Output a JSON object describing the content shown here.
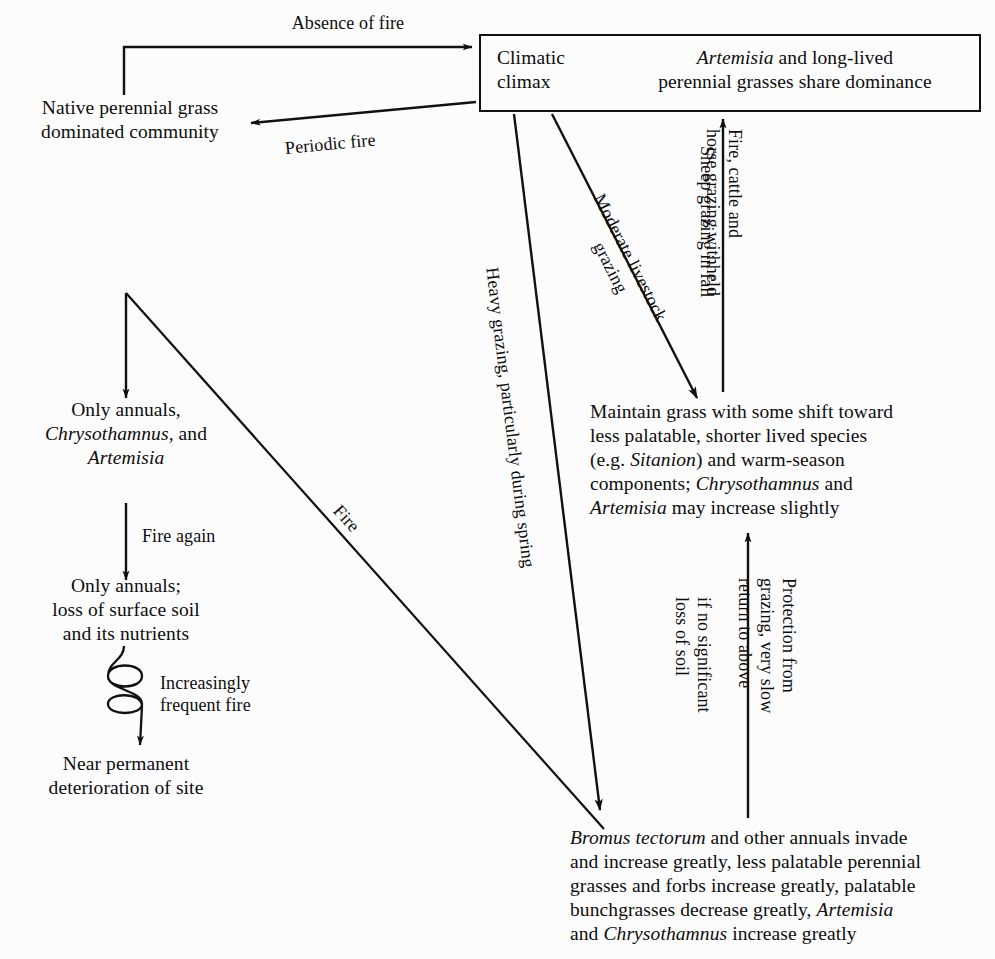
{
  "diagram": {
    "background_color": "#fcfcfc",
    "ink_color": "#111111"
  },
  "nodes": {
    "climatic_climax_label": "Climatic\nclimax",
    "climatic_climax_desc_line1_italic": "Artemisia",
    "climatic_climax_desc_line1_rest": " and long-lived",
    "climatic_climax_desc_line2": "perennial grasses share dominance",
    "native_grass": "Native perennial grass\ndominated community",
    "only_annuals_chrys": {
      "line1": "Only annuals,",
      "line2_italic": "Chrysothamnus",
      "line2_rest": ", and",
      "line3_italic": "Artemisia"
    },
    "only_annuals_soil": "Only annuals;\nloss of surface soil\nand its nutrients",
    "near_permanent": "Near permanent\ndeterioration of site",
    "maintain_grass": {
      "line1": "Maintain grass with some shift toward",
      "line2": "less palatable, shorter lived species",
      "line3_a": "(e.g. ",
      "line3_italic": "Sitanion",
      "line3_b": ") and warm-season",
      "line4_a": "components; ",
      "line4_italic": "Chrysothamnus",
      "line4_b": " and",
      "line5_italic": "Artemisia",
      "line5_rest": " may increase slightly"
    },
    "bromus_block": {
      "line1_italic": "Bromus tectorum",
      "line1_rest": " and other annuals invade",
      "line2": "and increase greatly, less palatable perennial",
      "line3": "grasses and forbs increase greatly, palatable",
      "line4_a": "bunchgrasses decrease greatly, ",
      "line4_italic": "Artemisia",
      "line5_a": "and ",
      "line5_italic": "Chrysothamnus",
      "line5_b": " increase greatly"
    }
  },
  "edge_labels": {
    "absence_of_fire": "Absence of fire",
    "periodic_fire": "Periodic fire",
    "moderate_livestock_grazing": "Moderate livestock\ngrazing",
    "heavy_grazing_spring": "Heavy grazing, particularly during spring",
    "sheep_grazing_fall": "Sheep grazing in fall",
    "fire_cattle_horse_withheld": "Fire, cattle and\nhorse grazing withheld",
    "fire_again": "Fire  again",
    "increasingly_frequent_fire": "Increasingly\nfrequent fire",
    "fire": "Fire",
    "protection_from_grazing": "Protection from\ngrazing, very slow\nreturn to above",
    "if_no_significant_loss": "if no significant\nloss of soil"
  }
}
